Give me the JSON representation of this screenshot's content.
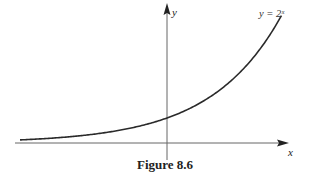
{
  "chart_data": {
    "type": "line",
    "title": "",
    "function": "y = 2^x",
    "curve_label": "y = 2ˣ",
    "xlabel": "x",
    "ylabel": "y",
    "xlim": [
      -3.4,
      2.4
    ],
    "ylim": [
      -0.2,
      5.6
    ],
    "series": [
      {
        "name": "y = 2^x",
        "x": [
          -3.0,
          -2.0,
          -1.0,
          0.0,
          1.0,
          2.0,
          2.35
        ],
        "y": [
          0.125,
          0.25,
          0.5,
          1.0,
          2.0,
          4.0,
          5.1
        ]
      }
    ],
    "grid": false,
    "ticks": false
  },
  "caption": "Figure 8.6",
  "colors": {
    "curve": "#2a2a2a",
    "axes": "#555555",
    "text": "#222222"
  }
}
